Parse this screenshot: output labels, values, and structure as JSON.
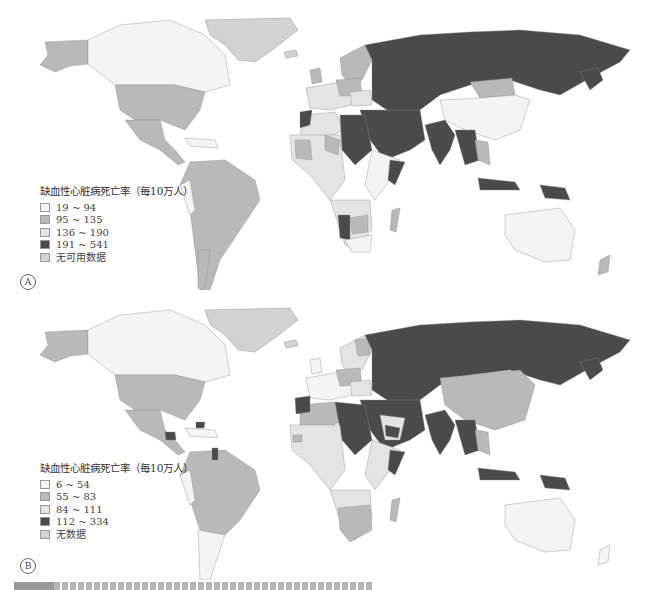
{
  "colors": {
    "class1": "#f4f4f4",
    "class2": "#b9b9b9",
    "class3": "#e4e4e4",
    "class4": "#4a4a4a",
    "nodata": "#d2d2d2",
    "border": "#8c8c8c"
  },
  "panels": [
    {
      "badge": "A",
      "legend": {
        "title": "缺血性心脏病死亡率（每10万人）",
        "items": [
          {
            "label": "19 ~ 94",
            "class": "class1"
          },
          {
            "label": "95 ~ 135",
            "class": "class2"
          },
          {
            "label": "136 ~ 190",
            "class": "class3"
          },
          {
            "label": "191 ~ 541",
            "class": "class4"
          },
          {
            "label": "无可用数据",
            "class": "nodata"
          }
        ]
      }
    },
    {
      "badge": "B",
      "legend": {
        "title": "缺血性心脏病死亡率（每10万人）",
        "items": [
          {
            "label": "6 ~ 54",
            "class": "class1"
          },
          {
            "label": "55 ~ 83",
            "class": "class2"
          },
          {
            "label": "84 ~ 111",
            "class": "class3"
          },
          {
            "label": "112 ~ 334",
            "class": "class4"
          },
          {
            "label": "无数据",
            "class": "nodata"
          }
        ]
      }
    }
  ]
}
